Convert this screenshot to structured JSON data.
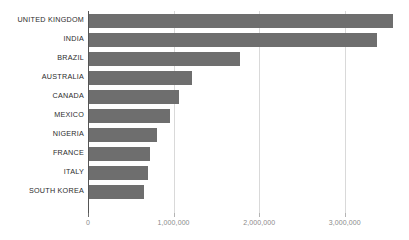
{
  "chart_data": {
    "type": "bar",
    "orientation": "horizontal",
    "title": "",
    "subtitle": "",
    "xlabel": "",
    "ylabel": "",
    "categories": [
      "UNITED KINGDOM",
      "INDIA",
      "BRAZIL",
      "AUSTRALIA",
      "CANADA",
      "MEXICO",
      "NIGERIA",
      "FRANCE",
      "ITALY",
      "SOUTH KOREA"
    ],
    "values": [
      3550000,
      3360000,
      1760000,
      1200000,
      1050000,
      950000,
      790000,
      710000,
      690000,
      640000
    ],
    "series": [
      {
        "name": "",
        "values": [
          3550000,
          3360000,
          1760000,
          1200000,
          1050000,
          950000,
          790000,
          710000,
          690000,
          640000
        ]
      }
    ],
    "xlim": [
      0,
      3750000
    ],
    "xticks": [
      0,
      1000000,
      2000000,
      3000000
    ],
    "xticklabels": [
      "0",
      "1,000,000",
      "2,000,000",
      "3,000,000"
    ],
    "grid": "vertical",
    "legend": "none",
    "bar_color": "#6e6e6e",
    "gridline_color": "#d9d9d9",
    "axis_color": "#555555",
    "tick_label_color": "#8a8a8a",
    "category_label_color": "#2b2b2b",
    "background_color": "#ffffff"
  }
}
